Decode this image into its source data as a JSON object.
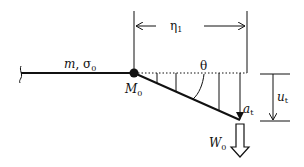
{
  "diagram": {
    "labels": {
      "beam_props": "m, σ",
      "beam_props_sub": "0",
      "node": "M",
      "node_sub": "0",
      "span": "η",
      "span_sub": "1",
      "angle": "θ",
      "deflection_arrow": "a",
      "deflection_arrow_sub": "t",
      "tip_displacement": "u",
      "tip_displacement_sub": "t",
      "load": "W",
      "load_sub": "0"
    },
    "colors": {
      "stroke": "#111111",
      "background": "#ffffff"
    }
  }
}
